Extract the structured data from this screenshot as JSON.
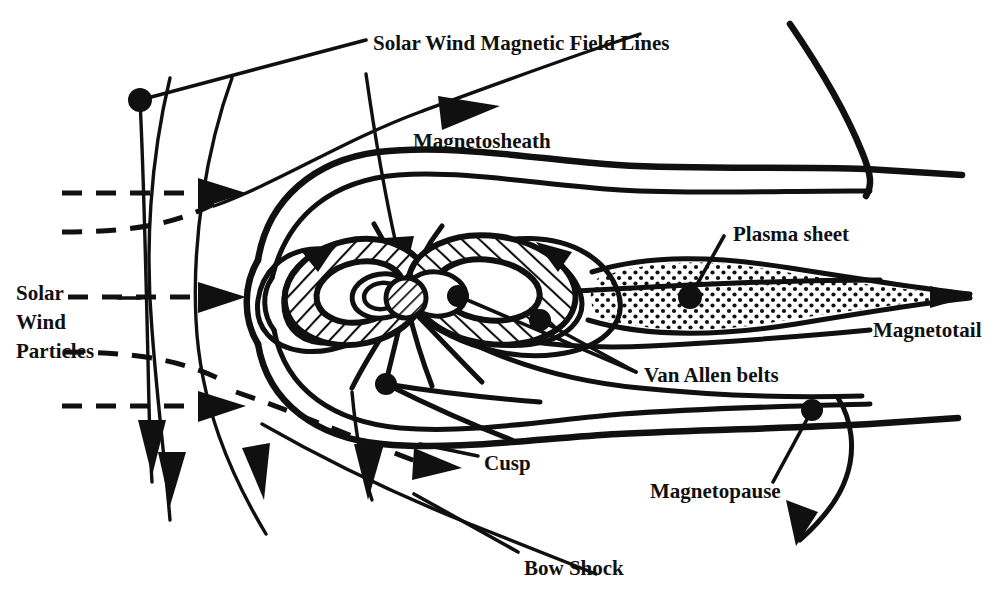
{
  "figure": {
    "background_color": "#ffffff",
    "ink_color": "#101010",
    "width": 1003,
    "height": 602
  },
  "labels": {
    "solar_wind_magnetic_field_lines": "Solar Wind Magnetic Field Lines",
    "magnetosheath": "Magnetosheath",
    "solar_wind_particles_line1": "Solar",
    "solar_wind_particles_line2": "Wind",
    "solar_wind_particles_line3": "Particles",
    "plasma_sheet": "Plasma sheet",
    "magnetotail": "Magnetotail",
    "van_allen_belts": "Van Allen belts",
    "cusp": "Cusp",
    "magnetopause": "Magnetopause",
    "bow_shock": "Bow Shock"
  },
  "features": [
    {
      "name": "bow-shock",
      "kind": "boundary-curve",
      "description": "Outer parabolic shock front upstream of Earth"
    },
    {
      "name": "magnetopause",
      "kind": "boundary-curve",
      "description": "Inner boundary of the magnetosphere"
    },
    {
      "name": "magnetosheath",
      "kind": "region",
      "description": "Shocked solar wind between bow shock and magnetopause"
    },
    {
      "name": "van-allen-belts",
      "kind": "hatched-torus",
      "description": "Two hatched radiation belt rings around Earth"
    },
    {
      "name": "plasma-sheet",
      "kind": "stippled-wedge",
      "description": "Stippled sheet extending down the magnetotail"
    },
    {
      "name": "magnetotail",
      "kind": "region",
      "description": "Elongated tail of the magnetosphere anti-sunward"
    },
    {
      "name": "cusp",
      "kind": "point",
      "description": "Polar cusp where field lines converge"
    },
    {
      "name": "earth",
      "kind": "hatched-disc",
      "description": "Earth at the centre of the dipole field"
    },
    {
      "name": "solar-wind-particles",
      "kind": "dashed-flow",
      "description": "Dashed arrows flowing from the left"
    },
    {
      "name": "solar-wind-magnetic-field-lines",
      "kind": "solid-flow",
      "description": "Solid draped interplanetary field lines"
    }
  ]
}
